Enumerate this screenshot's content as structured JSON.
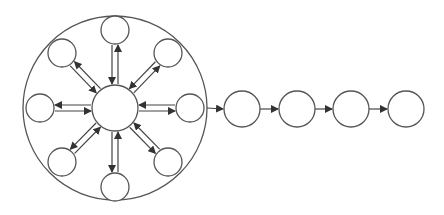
{
  "diagram": {
    "type": "hub-and-spoke cluster feeding a linear chain",
    "colors": {
      "stroke": "#555555",
      "fill": "#ffffff",
      "arrow": "#333333"
    },
    "cluster": {
      "boundary": {
        "cx": 115,
        "cy": 108,
        "r": 92
      },
      "hub": {
        "cx": 115,
        "cy": 108,
        "r": 23
      },
      "satellites": [
        {
          "id": "top",
          "cx": 115,
          "cy": 30,
          "r": 14
        },
        {
          "id": "top-right",
          "cx": 168,
          "cy": 53,
          "r": 14
        },
        {
          "id": "right",
          "cx": 190,
          "cy": 108,
          "r": 14
        },
        {
          "id": "bottom-right",
          "cx": 168,
          "cy": 162,
          "r": 14
        },
        {
          "id": "bottom",
          "cx": 115,
          "cy": 187,
          "r": 14
        },
        {
          "id": "bottom-left",
          "cx": 62,
          "cy": 162,
          "r": 14
        },
        {
          "id": "left",
          "cx": 40,
          "cy": 108,
          "r": 14
        },
        {
          "id": "top-left",
          "cx": 62,
          "cy": 53,
          "r": 14
        }
      ],
      "connection": "bidirectional (paired arrows hub<->satellite)"
    },
    "chain": {
      "nodes": [
        {
          "id": "chain-1",
          "cx": 242,
          "cy": 109,
          "r": 18
        },
        {
          "id": "chain-2",
          "cx": 297,
          "cy": 109,
          "r": 18
        },
        {
          "id": "chain-3",
          "cx": 351,
          "cy": 109,
          "r": 18
        },
        {
          "id": "chain-4",
          "cx": 406,
          "cy": 109,
          "r": 18
        }
      ],
      "connection": "unidirectional left-to-right"
    }
  }
}
